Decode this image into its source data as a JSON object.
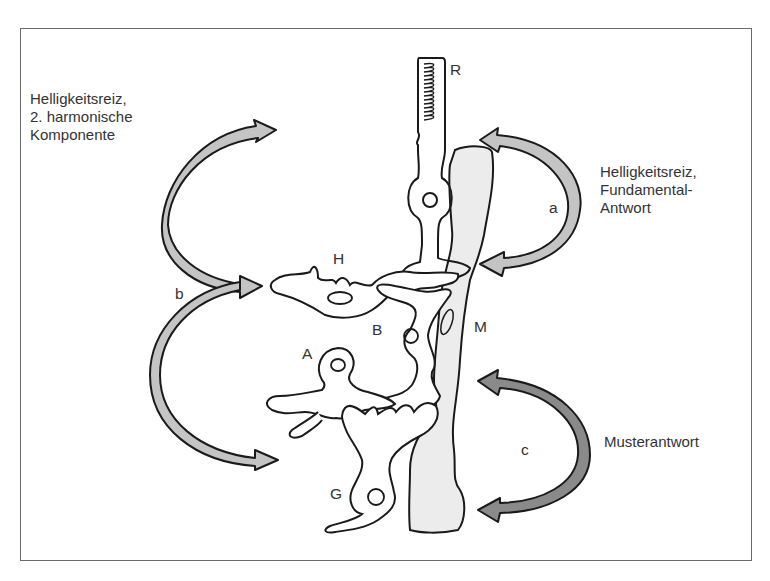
{
  "figure": {
    "left_caption": [
      "Helligkeitsreiz,",
      "2. harmonische",
      "Komponente"
    ],
    "right_caption_top": [
      "Helligkeitsreiz,",
      "Fundamental-",
      "Antwort"
    ],
    "right_caption_bottom": "Musterantwort"
  },
  "cell_labels": {
    "R": "R",
    "H": "H",
    "B": "B",
    "A": "A",
    "G": "G",
    "M": "M"
  },
  "arrow_labels": {
    "a": "a",
    "b": "b",
    "c": "c"
  },
  "colors": {
    "frame": "#6a6a6a",
    "outline": "#1a1a1a",
    "arrow_light": "#c4c4c4",
    "arrow_dark": "#8a8a8a",
    "muller_fill": "#ececec"
  }
}
